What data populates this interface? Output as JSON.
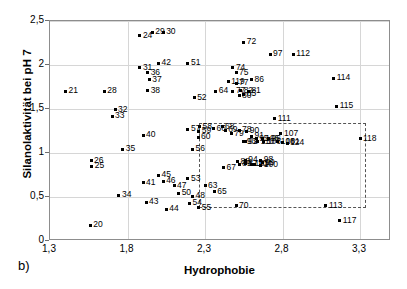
{
  "figure": {
    "panel_tag": "b)",
    "xlabel": "Hydrophobie",
    "ylabel": "Silanolaktivität bei pH 7"
  },
  "chart_data": {
    "type": "scatter",
    "title": "",
    "xlabel": "Hydrophobie",
    "ylabel": "Silanolaktivität bei pH 7",
    "xlim": [
      1.3,
      3.5
    ],
    "ylim": [
      0,
      2.5
    ],
    "xticks": [
      "1,3",
      "1,8",
      "2,3",
      "2,8",
      "3,3"
    ],
    "xtick_values": [
      1.3,
      1.8,
      2.3,
      2.8,
      3.3
    ],
    "yticks": [
      "0",
      "0,5",
      "1",
      "1,5",
      "2",
      "2,5"
    ],
    "ytick_values": [
      0,
      0.5,
      1.0,
      1.5,
      2.0,
      2.5
    ],
    "grid": true,
    "legend": null,
    "marker": "small-dot-with-number-label",
    "annotation_box": {
      "type": "dashed-rectangle",
      "x_range": [
        2.26,
        3.34
      ],
      "y_range": [
        0.37,
        1.34
      ]
    },
    "points": [
      {
        "label": "20",
        "x": 1.56,
        "y": 0.18
      },
      {
        "label": "21",
        "x": 1.4,
        "y": 1.7
      },
      {
        "label": "24",
        "x": 1.88,
        "y": 2.33
      },
      {
        "label": "25",
        "x": 1.57,
        "y": 0.85
      },
      {
        "label": "26",
        "x": 1.565,
        "y": 0.91
      },
      {
        "label": "28",
        "x": 1.65,
        "y": 1.7
      },
      {
        "label": "29",
        "x": 1.96,
        "y": 2.37
      },
      {
        "label": "30",
        "x": 2.03,
        "y": 2.37
      },
      {
        "label": "31",
        "x": 1.88,
        "y": 1.97
      },
      {
        "label": "32",
        "x": 1.72,
        "y": 1.49
      },
      {
        "label": "33",
        "x": 1.7,
        "y": 1.42
      },
      {
        "label": "34",
        "x": 1.745,
        "y": 0.52
      },
      {
        "label": "35",
        "x": 1.77,
        "y": 1.04
      },
      {
        "label": "36",
        "x": 1.93,
        "y": 1.91
      },
      {
        "label": "37",
        "x": 1.94,
        "y": 1.83
      },
      {
        "label": "38",
        "x": 1.93,
        "y": 1.71
      },
      {
        "label": "40",
        "x": 1.9,
        "y": 1.2
      },
      {
        "label": "41",
        "x": 1.9,
        "y": 0.66
      },
      {
        "label": "42",
        "x": 2.0,
        "y": 2.02
      },
      {
        "label": "43",
        "x": 1.92,
        "y": 0.44
      },
      {
        "label": "44",
        "x": 2.05,
        "y": 0.36
      },
      {
        "label": "45",
        "x": 2.0,
        "y": 0.75
      },
      {
        "label": "46",
        "x": 2.03,
        "y": 0.68
      },
      {
        "label": "47",
        "x": 2.1,
        "y": 0.63
      },
      {
        "label": "48",
        "x": 2.22,
        "y": 0.51
      },
      {
        "label": "50",
        "x": 2.13,
        "y": 0.54
      },
      {
        "label": "51",
        "x": 2.19,
        "y": 2.02
      },
      {
        "label": "52",
        "x": 2.23,
        "y": 1.63
      },
      {
        "label": "53",
        "x": 2.19,
        "y": 0.71
      },
      {
        "label": "54",
        "x": 2.2,
        "y": 0.43
      },
      {
        "label": "55",
        "x": 2.26,
        "y": 0.38
      },
      {
        "label": "56",
        "x": 2.22,
        "y": 1.04
      },
      {
        "label": "57",
        "x": 2.19,
        "y": 1.27
      },
      {
        "label": "58",
        "x": 2.265,
        "y": 1.3
      },
      {
        "label": "59",
        "x": 2.26,
        "y": 1.245
      },
      {
        "label": "60",
        "x": 2.255,
        "y": 1.18
      },
      {
        "label": "63",
        "x": 2.3,
        "y": 0.63
      },
      {
        "label": "64",
        "x": 2.37,
        "y": 1.7
      },
      {
        "label": "65",
        "x": 2.36,
        "y": 0.56
      },
      {
        "label": "66",
        "x": 2.355,
        "y": 1.275
      },
      {
        "label": "67",
        "x": 2.42,
        "y": 0.83
      },
      {
        "label": "68",
        "x": 2.41,
        "y": 1.3
      },
      {
        "label": "69",
        "x": 2.43,
        "y": 1.26
      },
      {
        "label": "70",
        "x": 2.5,
        "y": 0.4
      },
      {
        "label": "72",
        "x": 2.55,
        "y": 2.26
      },
      {
        "label": "74",
        "x": 2.48,
        "y": 1.97
      },
      {
        "label": "75",
        "x": 2.5,
        "y": 1.91
      },
      {
        "label": "77",
        "x": 2.5,
        "y": 1.79
      },
      {
        "label": "77",
        "x": 2.48,
        "y": 1.7
      },
      {
        "label": "78",
        "x": 2.52,
        "y": 1.26
      },
      {
        "label": "79",
        "x": 2.47,
        "y": 1.22
      },
      {
        "label": "80",
        "x": 2.52,
        "y": 1.65
      },
      {
        "label": "81",
        "x": 2.58,
        "y": 1.7
      },
      {
        "label": "82",
        "x": 2.53,
        "y": 1.71
      },
      {
        "label": "85",
        "x": 2.55,
        "y": 1.67
      },
      {
        "label": "86",
        "x": 2.6,
        "y": 1.83
      },
      {
        "label": "87",
        "x": 2.56,
        "y": 0.88
      },
      {
        "label": "88",
        "x": 2.51,
        "y": 0.9
      },
      {
        "label": "89",
        "x": 2.52,
        "y": 0.87
      },
      {
        "label": "90",
        "x": 2.57,
        "y": 1.25
      },
      {
        "label": "91",
        "x": 2.6,
        "y": 1.19
      },
      {
        "label": "92",
        "x": 2.56,
        "y": 1.13
      },
      {
        "label": "93",
        "x": 2.55,
        "y": 1.13
      },
      {
        "label": "94",
        "x": 2.56,
        "y": 0.92
      },
      {
        "label": "95",
        "x": 2.63,
        "y": 1.16
      },
      {
        "label": "96",
        "x": 2.71,
        "y": 1.16
      },
      {
        "label": "97",
        "x": 2.72,
        "y": 2.12
      },
      {
        "label": "98",
        "x": 2.66,
        "y": 0.92
      },
      {
        "label": "99",
        "x": 2.67,
        "y": 0.89
      },
      {
        "label": "100",
        "x": 2.66,
        "y": 0.86
      },
      {
        "label": "101",
        "x": 2.8,
        "y": 1.12
      },
      {
        "label": "103",
        "x": 2.6,
        "y": 0.87
      },
      {
        "label": "104",
        "x": 2.62,
        "y": 0.87
      },
      {
        "label": "105",
        "x": 2.67,
        "y": 1.16
      },
      {
        "label": "106",
        "x": 2.68,
        "y": 1.13
      },
      {
        "label": "107",
        "x": 2.79,
        "y": 1.22
      },
      {
        "label": "108",
        "x": 2.77,
        "y": 1.13
      },
      {
        "label": "110",
        "x": 2.64,
        "y": 1.13
      },
      {
        "label": "111",
        "x": 2.75,
        "y": 1.39
      },
      {
        "label": "112",
        "x": 2.87,
        "y": 2.12
      },
      {
        "label": "113",
        "x": 3.08,
        "y": 0.4
      },
      {
        "label": "114",
        "x": 3.13,
        "y": 1.85
      },
      {
        "label": "115",
        "x": 3.15,
        "y": 1.53
      },
      {
        "label": "117",
        "x": 3.17,
        "y": 0.23
      },
      {
        "label": "118",
        "x": 3.3,
        "y": 1.16
      },
      {
        "label": "119",
        "x": 2.45,
        "y": 1.81
      },
      {
        "label": "124",
        "x": 2.83,
        "y": 1.11
      }
    ]
  }
}
